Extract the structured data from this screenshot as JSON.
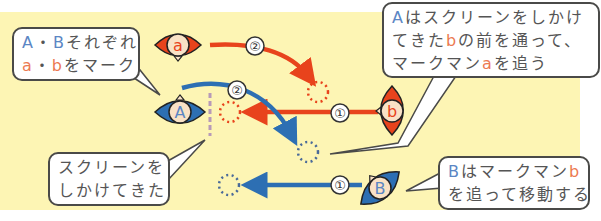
{
  "colors": {
    "field": "#fdf5b4",
    "red_team": "#e8431c",
    "blue_team": "#2d6fb3",
    "screen_line": "#b79ab8",
    "text": "#555555",
    "label_blue": "#5b86c4",
    "label_red": "#ec7a52"
  },
  "players": [
    {
      "id": "a",
      "label": "a",
      "team": "red",
      "role": "defender"
    },
    {
      "id": "b",
      "label": "b",
      "team": "red",
      "role": "defender"
    },
    {
      "id": "A",
      "label": "A",
      "team": "blue",
      "role": "attacker"
    },
    {
      "id": "B",
      "label": "B",
      "team": "blue",
      "role": "attacker"
    }
  ],
  "moves": [
    {
      "player": "a",
      "step": "②",
      "color": "red"
    },
    {
      "player": "b",
      "step": "①",
      "color": "red"
    },
    {
      "player": "A",
      "step": "②",
      "color": "blue"
    },
    {
      "player": "B",
      "step": "①",
      "color": "blue"
    }
  ],
  "callouts": {
    "top_left": {
      "line1": {
        "p1": "A",
        "p2": "・",
        "p3": "B",
        "p4": "それぞれ"
      },
      "line2": {
        "p1": "a",
        "p2": "・",
        "p3": "b",
        "p4": "をマーク"
      }
    },
    "top_right": {
      "line1": {
        "p1": "A",
        "p2": "はスクリーンをしかけ"
      },
      "line2": {
        "p1": "てきた",
        "p2": "b",
        "p3": "の前を通って、"
      },
      "line3": {
        "p1": "マークマン",
        "p2": "a",
        "p3": "を追う"
      }
    },
    "bottom_left": {
      "line1": "スクリーンを",
      "line2": "しかけてきた"
    },
    "bottom_right": {
      "line1": {
        "p1": "B",
        "p2": "はマークマン",
        "p3": "b"
      },
      "line2": "を追って移動する"
    }
  }
}
